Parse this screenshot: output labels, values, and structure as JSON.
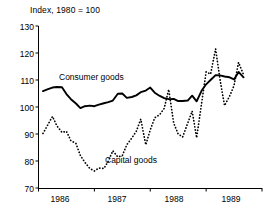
{
  "chart_data": {
    "type": "line",
    "title": "Index, 1980 = 100",
    "xlabel": "",
    "ylabel": "",
    "ylim": [
      70,
      130
    ],
    "yticks": [
      70,
      80,
      90,
      100,
      110,
      120,
      130
    ],
    "xlim": [
      1985.5,
      1989.5
    ],
    "xticks": [
      1986,
      1987,
      1988,
      1989
    ],
    "xtick_labels": [
      "1986",
      "1987",
      "1988",
      "1989"
    ],
    "grid": false,
    "legend": "inline-annotations",
    "annotations": [
      {
        "text": "Consumer goods",
        "x": 1986.3,
        "y": 112.5
      },
      {
        "text": "Capital goods",
        "x": 1987.1,
        "y": 81.5
      }
    ],
    "series": [
      {
        "name": "Consumer goods",
        "style": "solid",
        "color": "#000000",
        "x": [
          1985.58,
          1985.67,
          1985.75,
          1985.83,
          1985.92,
          1986.0,
          1986.08,
          1986.17,
          1986.25,
          1986.33,
          1986.42,
          1986.5,
          1986.58,
          1986.67,
          1986.75,
          1986.83,
          1986.92,
          1987.0,
          1987.08,
          1987.17,
          1987.25,
          1987.33,
          1987.42,
          1987.5,
          1987.58,
          1987.67,
          1987.75,
          1987.83,
          1987.92,
          1988.0,
          1988.08,
          1988.17,
          1988.25,
          1988.33,
          1988.42,
          1988.5,
          1988.58,
          1988.67,
          1988.75,
          1988.83,
          1988.92,
          1989.0,
          1989.08,
          1989.17
        ],
        "values": [
          105.9,
          106.6,
          107.2,
          107.4,
          107.3,
          104.8,
          102.9,
          101.3,
          99.6,
          100.3,
          100.5,
          100.3,
          100.9,
          101.4,
          101.8,
          102.4,
          104.9,
          105.0,
          103.4,
          103.7,
          104.3,
          105.5,
          106.1,
          107.2,
          105.3,
          104.1,
          103.3,
          102.9,
          103.0,
          102.2,
          102.2,
          102.4,
          104.2,
          102.1,
          106.1,
          108.4,
          110.0,
          111.8,
          111.7,
          111.3,
          111.0,
          110.2,
          113.0,
          111.0
        ]
      },
      {
        "name": "Capital goods",
        "style": "dotted",
        "color": "#000000",
        "x": [
          1985.58,
          1985.67,
          1985.75,
          1985.83,
          1985.92,
          1986.0,
          1986.08,
          1986.17,
          1986.25,
          1986.33,
          1986.42,
          1986.5,
          1986.58,
          1986.67,
          1986.75,
          1986.83,
          1986.92,
          1987.0,
          1987.08,
          1987.17,
          1987.25,
          1987.33,
          1987.42,
          1987.5,
          1987.58,
          1987.67,
          1987.75,
          1987.83,
          1987.92,
          1988.0,
          1988.08,
          1988.17,
          1988.25,
          1988.33,
          1988.42,
          1988.5,
          1988.58,
          1988.67,
          1988.75,
          1988.83,
          1988.92,
          1989.0,
          1989.08,
          1989.17
        ],
        "values": [
          90.2,
          93.5,
          96.5,
          93.0,
          90.6,
          91.0,
          87.5,
          86.5,
          82.0,
          79.5,
          77.2,
          76.3,
          77.4,
          77.2,
          80.0,
          83.8,
          81.5,
          82.0,
          86.0,
          88.5,
          91.0,
          95.5,
          86.0,
          91.5,
          96.0,
          97.2,
          99.5,
          106.5,
          94.0,
          90.0,
          88.9,
          94.0,
          98.5,
          88.6,
          101.5,
          113.0,
          112.2,
          121.5,
          110.0,
          100.5,
          104.0,
          108.0,
          116.5,
          112.0
        ]
      }
    ]
  },
  "axis": {
    "y_labels": [
      "130",
      "120",
      "110",
      "100",
      "90",
      "80",
      "70"
    ],
    "x_labels": [
      "1986",
      "1987",
      "1988",
      "1989"
    ],
    "title_text": "Index, 1980 = 100"
  },
  "labels": {
    "consumer": "Consumer goods",
    "capital": "Capital goods"
  }
}
